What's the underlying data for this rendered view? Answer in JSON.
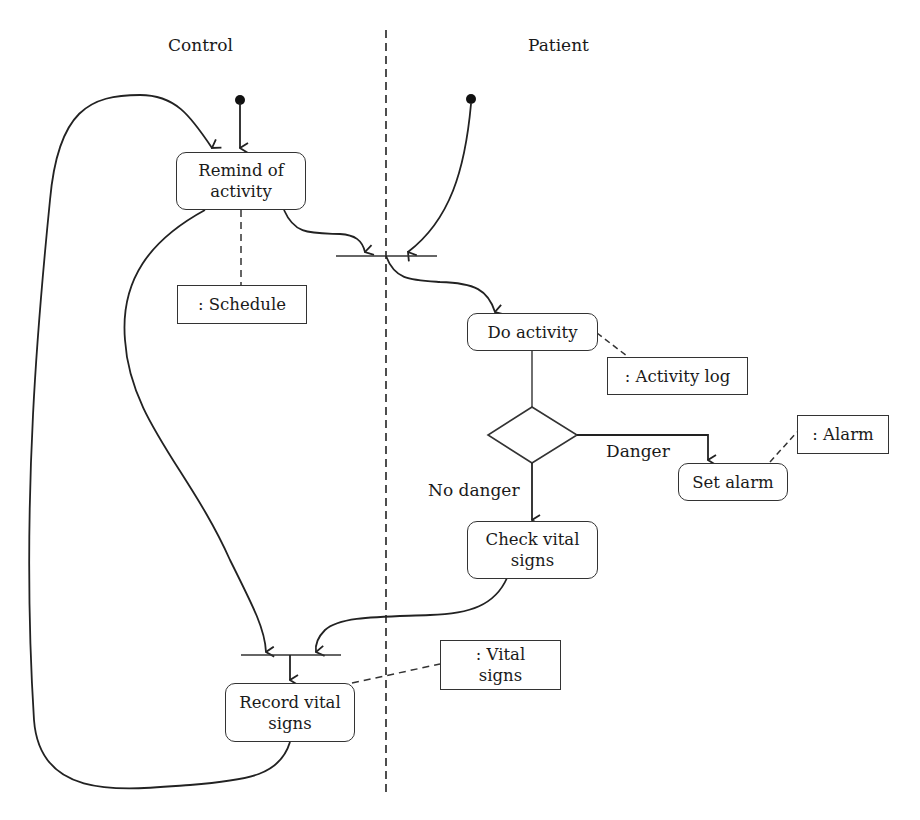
{
  "swimlanes": {
    "left": "Control",
    "right": "Patient"
  },
  "activities": {
    "remind": "Remind of activity",
    "do_activity": "Do activity",
    "set_alarm": "Set alarm",
    "check_vitals": "Check vital signs",
    "record_vitals": "Record vital signs"
  },
  "objects": {
    "schedule": ": Schedule",
    "activity_log": ": Activity log",
    "alarm": ": Alarm",
    "vital_signs": ": Vital signs"
  },
  "guards": {
    "danger": "Danger",
    "no_danger": "No danger"
  }
}
